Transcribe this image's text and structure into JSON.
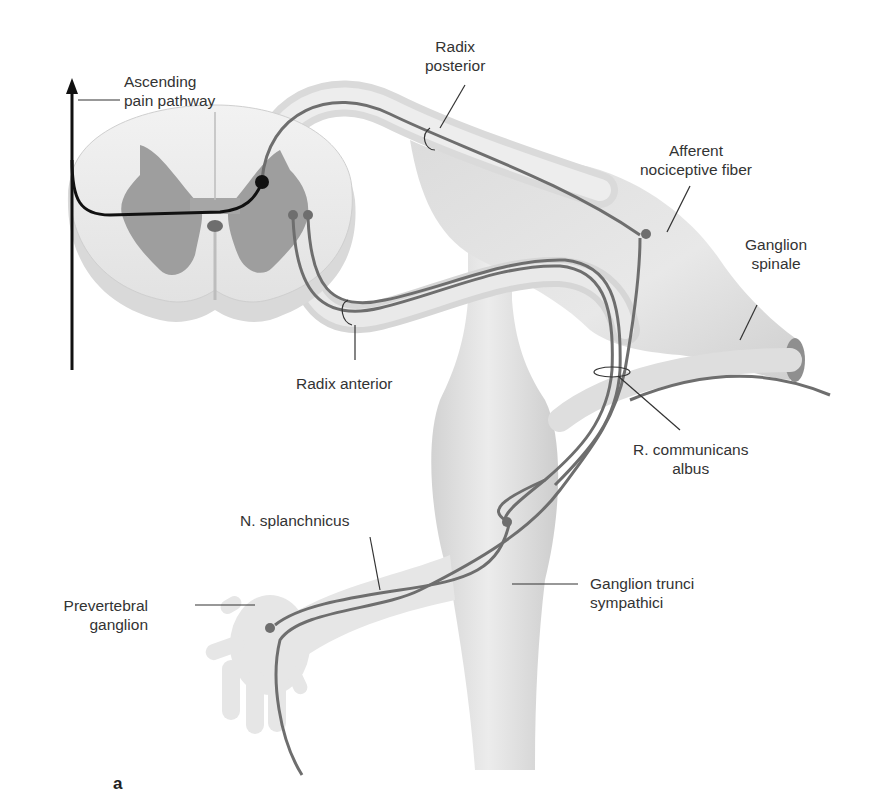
{
  "figure": {
    "type": "anatomical-diagram",
    "panel_letter": "a",
    "colors": {
      "tissue_fill": "#e4e4e4",
      "tissue_shade": "#cfcfcf",
      "gray_matter": "#9a9a9a",
      "fiber": "#6e6e6e",
      "pain_pathway": "#111111",
      "label_text": "#333333",
      "leader_line": "#333333"
    }
  },
  "labels": {
    "ascending": {
      "line1": "Ascending",
      "line2": "pain pathway"
    },
    "radix_posterior": {
      "line1": "Radix",
      "line2": "posterior"
    },
    "afferent": {
      "line1": "Afferent",
      "line2": "nociceptive fiber"
    },
    "ganglion_spinale": {
      "line1": "Ganglion",
      "line2": "spinale"
    },
    "radix_anterior": {
      "line1": "Radix anterior"
    },
    "r_communicans": {
      "line1": "R. communicans",
      "line2": "albus"
    },
    "n_splanchnicus": {
      "line1": "N. splanchnicus"
    },
    "ganglion_trunci": {
      "line1": "Ganglion trunci",
      "line2": "sympathici"
    },
    "prevertebral": {
      "line1": "Prevertebral",
      "line2": "ganglion"
    }
  },
  "structures": [
    {
      "name": "spinal-cord-cross-section"
    },
    {
      "name": "radix-posterior"
    },
    {
      "name": "radix-anterior"
    },
    {
      "name": "ganglion-spinale"
    },
    {
      "name": "spinal-nerve"
    },
    {
      "name": "ramus-communicans-albus"
    },
    {
      "name": "sympathetic-trunk"
    },
    {
      "name": "ganglion-trunci-sympathici"
    },
    {
      "name": "nervus-splanchnicus"
    },
    {
      "name": "prevertebral-ganglion"
    },
    {
      "name": "ascending-pain-pathway-arrow"
    }
  ]
}
